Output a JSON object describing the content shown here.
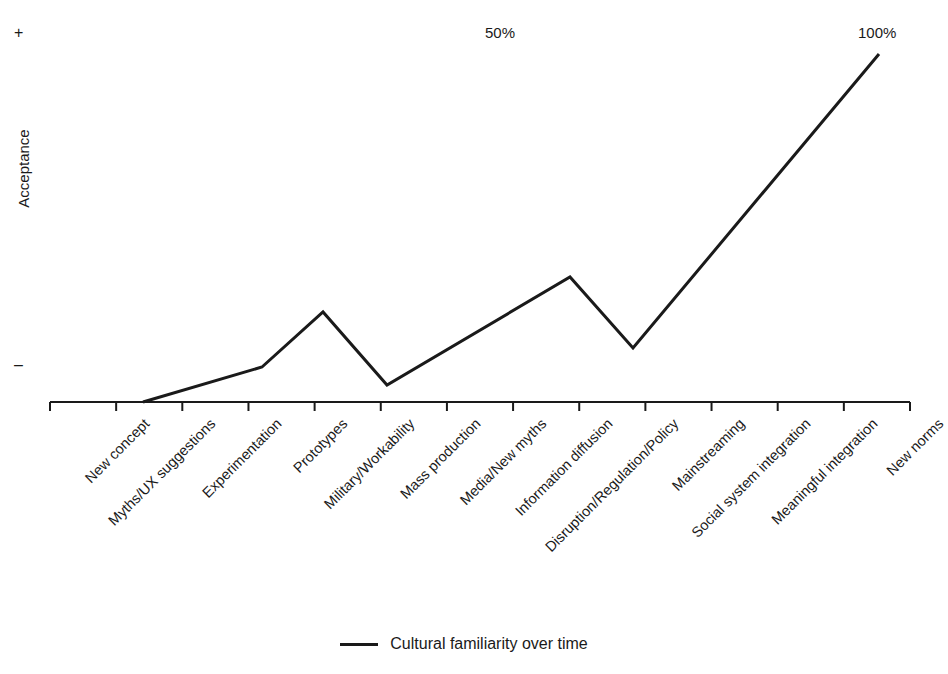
{
  "chart_data": {
    "type": "line",
    "title": "",
    "xlabel": "",
    "ylabel": "Acceptance",
    "grid": false,
    "legend_position": "bottom-center",
    "axis": {
      "y_top_marker": "+",
      "y_bottom_marker": "–",
      "x_scale_mid": "50%",
      "x_scale_end": "100%"
    },
    "categories": [
      "New concept",
      "Myths/UX suggestions",
      "Experimentation",
      "Prototypes",
      "Military/Workability",
      "Mass production",
      "Media/New myths",
      "Information diffusion",
      "Disruption/Regulation/Policy",
      "Mainstreaming",
      "Social system integration",
      "Meaningful integration",
      "New norms"
    ],
    "series": [
      {
        "name": "Cultural familiarity over time",
        "color": "#1a1a1a",
        "values": [
          0,
          10,
          16,
          32,
          7,
          16,
          25,
          42,
          27,
          50,
          73,
          96,
          119
        ],
        "points": [
          {
            "x": 143,
            "y": 402
          },
          {
            "x": 262,
            "y": 367
          },
          {
            "x": 323,
            "y": 312
          },
          {
            "x": 387,
            "y": 385
          },
          {
            "x": 570,
            "y": 277
          },
          {
            "x": 633,
            "y": 348
          },
          {
            "x": 879,
            "y": 54
          }
        ]
      }
    ],
    "legend": [
      {
        "label": "Cultural familiarity over time",
        "color": "#1a1a1a"
      }
    ]
  },
  "axis_geometry": {
    "x_axis_y": 402,
    "x_axis_start": 50,
    "x_axis_end": 910,
    "tick_count": 14,
    "tick_spacing": 61.43,
    "tick_length": 9
  },
  "colors": {
    "line": "#1a1a1a",
    "axis": "#1a1a1a",
    "background": "#ffffff",
    "text": "#1a1a1a"
  }
}
